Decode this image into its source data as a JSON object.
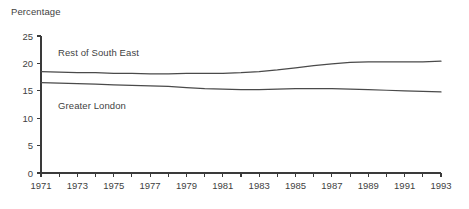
{
  "chart_data": {
    "type": "line",
    "title": "",
    "ylabel": "Percentage",
    "xlabel": "",
    "ylim": [
      0,
      25
    ],
    "yticks": [
      0,
      5,
      10,
      15,
      20,
      25
    ],
    "xlim": [
      1971,
      1993
    ],
    "xticks": [
      1971,
      1972,
      1973,
      1974,
      1975,
      1976,
      1977,
      1978,
      1979,
      1980,
      1981,
      1982,
      1983,
      1984,
      1985,
      1986,
      1987,
      1988,
      1989,
      1990,
      1991,
      1992,
      1993
    ],
    "xtick_labels": [
      "1971",
      "",
      "1973",
      "",
      "1975",
      "",
      "1977",
      "",
      "1979",
      "",
      "1981",
      "",
      "1983",
      "",
      "1985",
      "",
      "1987",
      "",
      "1989",
      "",
      "1991",
      "",
      "1993"
    ],
    "grid": false,
    "legend_position": "inline-annotation",
    "x": [
      1971,
      1972,
      1973,
      1974,
      1975,
      1976,
      1977,
      1978,
      1979,
      1980,
      1981,
      1982,
      1983,
      1984,
      1985,
      1986,
      1987,
      1988,
      1989,
      1990,
      1991,
      1992,
      1993
    ],
    "series": [
      {
        "name": "Rest of South East",
        "color": "#4a4a4a",
        "values": [
          18.5,
          18.4,
          18.3,
          18.3,
          18.2,
          18.2,
          18.1,
          18.1,
          18.2,
          18.2,
          18.2,
          18.3,
          18.5,
          18.8,
          19.2,
          19.6,
          19.9,
          20.2,
          20.3,
          20.3,
          20.3,
          20.3,
          20.4
        ]
      },
      {
        "name": "Greater London",
        "color": "#4a4a4a",
        "values": [
          16.5,
          16.4,
          16.3,
          16.2,
          16.1,
          16.0,
          15.9,
          15.8,
          15.6,
          15.4,
          15.3,
          15.2,
          15.2,
          15.3,
          15.4,
          15.4,
          15.4,
          15.3,
          15.2,
          15.1,
          15.0,
          14.9,
          14.8
        ]
      }
    ],
    "annotations": [
      {
        "text": "Rest of South East",
        "x": 1972.0,
        "y": 22.0
      },
      {
        "text": "Greater London",
        "x": 1972.0,
        "y": 12.5
      }
    ]
  },
  "axis": {
    "y_title": "Percentage",
    "y_tick_labels": [
      "25",
      "20",
      "15",
      "10",
      "5",
      "0"
    ],
    "x_tick_labels": [
      "1971",
      "1973",
      "1975",
      "1977",
      "1979",
      "1981",
      "1983",
      "1985",
      "1987",
      "1989",
      "1991",
      "1993"
    ]
  },
  "labels": {
    "rest_of_south_east": "Rest of South East",
    "greater_london": "Greater London"
  },
  "colors": {
    "line": "#4a4a4a",
    "axis": "#3a3a3a",
    "text": "#3f3f3f",
    "background": "#ffffff"
  }
}
